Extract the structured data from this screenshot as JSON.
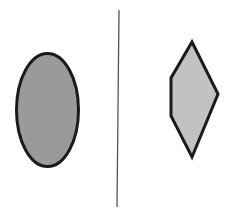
{
  "canvas": {
    "width": 235,
    "height": 216,
    "background_color": "#ffffff"
  },
  "shapes": {
    "left": {
      "name": "ellipse",
      "label": "ellipse",
      "fill_color": "#9a9a9a",
      "stroke_color": "#1a1a1a",
      "stroke_width": 3,
      "center_x": 47.5,
      "center_y": 110,
      "radius_x": 31,
      "radius_y": 56.5
    },
    "right": {
      "name": "pentagon-kite",
      "label": "pentagon",
      "fill_color": "#c2c2c2",
      "stroke_color": "#1a1a1a",
      "stroke_width": 3,
      "points": "192,42 218,94 192,157 171,116 171,78",
      "vertices": [
        {
          "name": "top-apex",
          "x": 192,
          "y": 42
        },
        {
          "name": "right-vertex",
          "x": 218,
          "y": 94
        },
        {
          "name": "bottom-apex",
          "x": 192,
          "y": 157
        },
        {
          "name": "lower-left",
          "x": 171,
          "y": 116
        },
        {
          "name": "upper-left",
          "x": 171,
          "y": 78
        }
      ]
    }
  },
  "divider": {
    "name": "vertical-divider-line",
    "stroke_color": "#555555",
    "stroke_width": 1.3,
    "x1": 119,
    "y1": 10,
    "x2": 117,
    "y2": 207
  }
}
